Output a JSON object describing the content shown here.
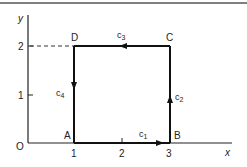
{
  "diagram": {
    "axes": {
      "x_label": "x",
      "y_label": "y",
      "origin_label": "O",
      "x_ticks": [
        "1",
        "2",
        "3"
      ],
      "y_ticks": [
        "1",
        "2"
      ]
    },
    "vertices": {
      "A": {
        "label": "A",
        "x": 1,
        "y": 0
      },
      "B": {
        "label": "B",
        "x": 3,
        "y": 0
      },
      "C": {
        "label": "C",
        "x": 3,
        "y": 2
      },
      "D": {
        "label": "D",
        "x": 1,
        "y": 2
      }
    },
    "paths": [
      {
        "name": "c1",
        "base": "c",
        "sub": "1",
        "from": "A",
        "to": "B",
        "direction": "right"
      },
      {
        "name": "c2",
        "base": "c",
        "sub": "2",
        "from": "B",
        "to": "C",
        "direction": "up"
      },
      {
        "name": "c3",
        "base": "c",
        "sub": "3",
        "from": "C",
        "to": "D",
        "direction": "left"
      },
      {
        "name": "c4",
        "base": "c",
        "sub": "4",
        "from": "D",
        "to": "A",
        "direction": "down"
      }
    ],
    "colors": {
      "line": "#1a1a1a",
      "border": "#555555"
    }
  }
}
